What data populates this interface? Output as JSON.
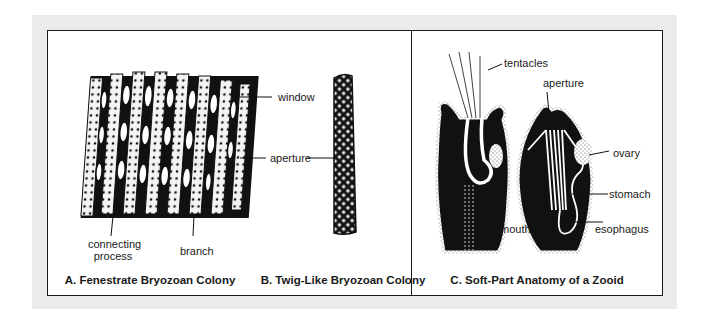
{
  "figure": {
    "panels": [
      {
        "id": "A",
        "caption": "A. Fenestrate Bryozoan Colony",
        "labels": {
          "window": "window",
          "aperture": "aperture",
          "connecting_process_line1": "connecting",
          "connecting_process_line2": "process",
          "branch": "branch"
        }
      },
      {
        "id": "B",
        "caption": "B. Twig-Like Bryozoan Colony"
      },
      {
        "id": "C",
        "caption": "C. Soft-Part Anatomy of a Zooid",
        "labels": {
          "tentacles": "tentacles",
          "aperture": "aperture",
          "ovary": "ovary",
          "stomach": "stomach",
          "mouth": "mouth",
          "esophagus": "esophagus"
        }
      }
    ],
    "colors": {
      "frame_bg": "#ebebeb",
      "border": "#1a1a1a",
      "ink": "#111111",
      "paper": "#ffffff"
    }
  }
}
